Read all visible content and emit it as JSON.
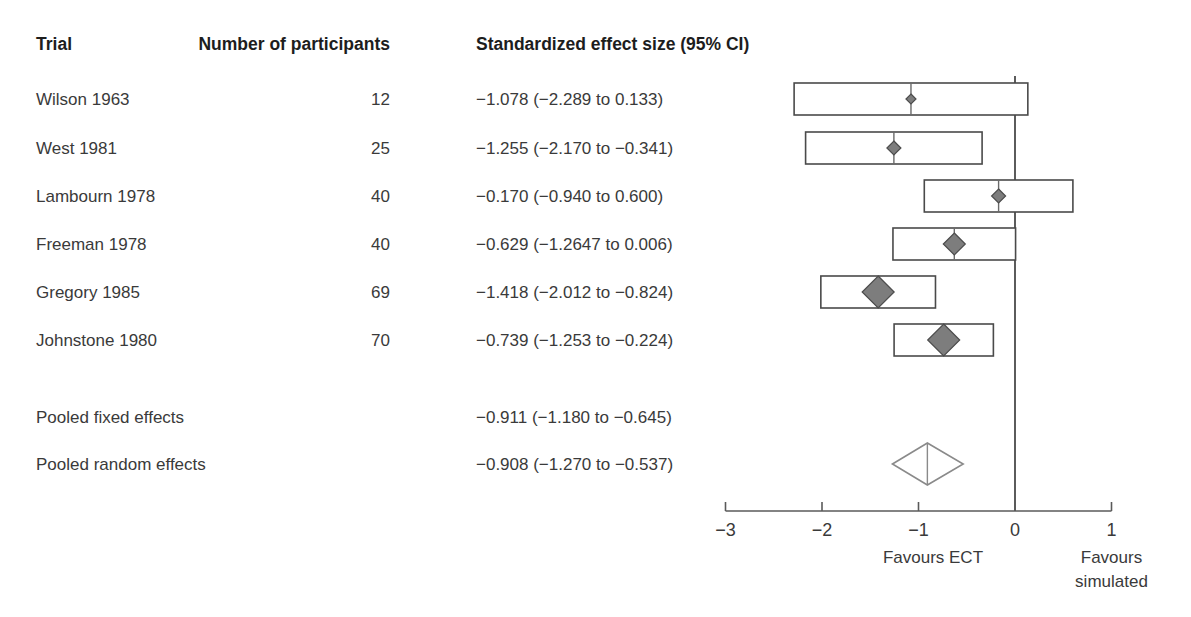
{
  "table": {
    "headers": {
      "trial": "Trial",
      "participants": "Number of participants",
      "effect": "Standardized effect size (95% CI)"
    },
    "rows": [
      {
        "trial": "Wilson 1963",
        "n": "12",
        "effect_text": "−1.078 (−2.289 to 0.133)"
      },
      {
        "trial": "West 1981",
        "n": "25",
        "effect_text": "−1.255 (−2.170 to −0.341)"
      },
      {
        "trial": "Lambourn 1978",
        "n": "40",
        "effect_text": "−0.170 (−0.940 to 0.600)"
      },
      {
        "trial": "Freeman 1978",
        "n": "40",
        "effect_text": "−0.629 (−1.2647 to 0.006)"
      },
      {
        "trial": "Gregory 1985",
        "n": "69",
        "effect_text": "−1.418 (−2.012 to −0.824)"
      },
      {
        "trial": "Johnstone 1980",
        "n": "70",
        "effect_text": "−0.739 (−1.253 to −0.224)"
      }
    ],
    "pooled": [
      {
        "trial": "Pooled fixed effects",
        "n": "",
        "effect_text": "−0.911 (−1.180 to −0.645)"
      },
      {
        "trial": "Pooled random effects",
        "n": "",
        "effect_text": "−0.908 (−1.270 to −0.537)"
      }
    ]
  },
  "axis": {
    "ticks": [
      "−3",
      "−2",
      "−1",
      "0",
      "1"
    ],
    "tick_values": [
      -3,
      -2,
      -1,
      0,
      1
    ],
    "range": [
      -3,
      1
    ],
    "favours_left": "Favours ECT",
    "favours_right_line1": "Favours",
    "favours_right_line2": "simulated",
    "null_value": 0
  },
  "colors": {
    "text": "#3a3a3a",
    "header_text": "#1d1d1d",
    "box_stroke": "#4a4a4a",
    "marker_fill": "#7d7d7d",
    "marker_stroke": "#4c4c4c",
    "null_line": "#4a4a4a",
    "pooled_stroke": "#8a8a8a",
    "background": "#ffffff"
  },
  "chart_data": {
    "type": "forest",
    "title": "",
    "xlabel": "Standardized effect size (95% CI)",
    "ylabel": "",
    "xlim": [
      -3,
      1
    ],
    "xticks": [
      -3,
      -2,
      -1,
      0,
      1
    ],
    "grid": false,
    "legend": "none",
    "null_line": 0,
    "annotations": [
      "Favours ECT",
      "Favours simulated"
    ],
    "studies": [
      {
        "name": "Wilson 1963",
        "n": 12,
        "estimate": -1.078,
        "ci_low": -2.289,
        "ci_high": 0.133,
        "marker_size": 5
      },
      {
        "name": "West 1981",
        "n": 25,
        "estimate": -1.255,
        "ci_low": -2.17,
        "ci_high": -0.341,
        "marker_size": 7
      },
      {
        "name": "Lambourn 1978",
        "n": 40,
        "estimate": -0.17,
        "ci_low": -0.94,
        "ci_high": 0.6,
        "marker_size": 7
      },
      {
        "name": "Freeman 1978",
        "n": 40,
        "estimate": -0.629,
        "ci_low": -1.2647,
        "ci_high": 0.006,
        "marker_size": 11
      },
      {
        "name": "Gregory 1985",
        "n": 69,
        "estimate": -1.418,
        "ci_low": -2.012,
        "ci_high": -0.824,
        "marker_size": 16
      },
      {
        "name": "Johnstone 1980",
        "n": 70,
        "estimate": -0.739,
        "ci_low": -1.253,
        "ci_high": -0.224,
        "marker_size": 16
      }
    ],
    "pooled": [
      {
        "name": "Pooled fixed effects",
        "estimate": -0.911,
        "ci_low": -1.18,
        "ci_high": -0.645,
        "shape": "none"
      },
      {
        "name": "Pooled random effects",
        "estimate": -0.908,
        "ci_low": -1.27,
        "ci_high": -0.537,
        "shape": "diamond"
      }
    ]
  }
}
